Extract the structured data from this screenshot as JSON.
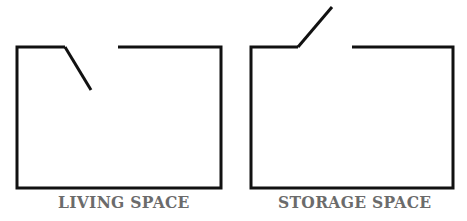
{
  "panels": [
    {
      "label": "LIVING SPACE",
      "door_state": "open-inward",
      "box": {
        "x1": 17,
        "y1": 47,
        "x2": 221,
        "y2": 188
      },
      "door": {
        "hinge": [
          65,
          47
        ],
        "tip": [
          91,
          90
        ]
      },
      "wall_gap_end_x": 118
    },
    {
      "label": "STORAGE SPACE",
      "door_state": "open-outward",
      "box": {
        "x1": 251,
        "y1": 47,
        "x2": 453,
        "y2": 188
      },
      "door": {
        "hinge": [
          298,
          47
        ],
        "tip": [
          332,
          7
        ]
      },
      "wall_gap_end_x": 352
    }
  ],
  "colors": {
    "line": "#111111",
    "label": "#6b6b6b",
    "background": "#ffffff"
  }
}
